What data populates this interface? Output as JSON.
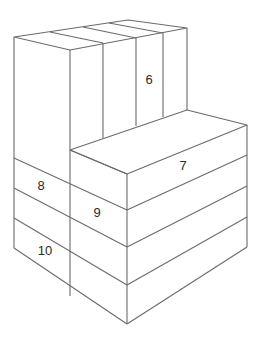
{
  "diagram": {
    "type": "isometric-block-stack",
    "line_color": "#6b6b6b",
    "label_color": "#2a2a2a",
    "labels": [
      {
        "id": "6",
        "text": "6",
        "x": 149,
        "y": 81
      },
      {
        "id": "7",
        "text": "7",
        "x": 183,
        "y": 167
      },
      {
        "id": "8",
        "text": "8",
        "x": 41,
        "y": 187
      },
      {
        "id": "9",
        "text": "9",
        "x": 97,
        "y": 214
      },
      {
        "id": "10",
        "text": "10",
        "x": 45,
        "y": 252
      }
    ]
  }
}
